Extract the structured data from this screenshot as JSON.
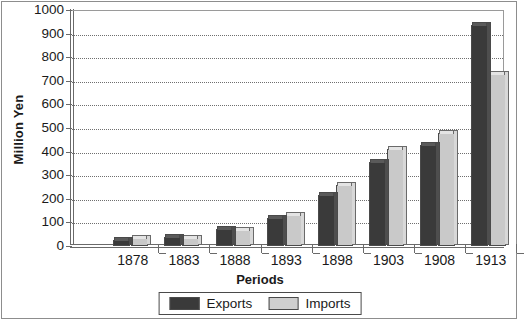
{
  "chart_data": {
    "type": "bar",
    "title": "",
    "xlabel": "Periods",
    "ylabel": "Million Yen",
    "categories": [
      "1878",
      "1883",
      "1888",
      "1893",
      "1898",
      "1903",
      "1908",
      "1913"
    ],
    "series": [
      {
        "name": "Exports",
        "color": "#3a3a3a",
        "values": [
          25,
          38,
          70,
          120,
          215,
          355,
          430,
          935
        ]
      },
      {
        "name": "Imports",
        "color": "#c9c9c9",
        "values": [
          32,
          32,
          68,
          130,
          260,
          410,
          480,
          730
        ]
      }
    ],
    "ylim": [
      0,
      1000
    ],
    "ytick_step": 100,
    "yticks": [
      "0",
      "100",
      "200",
      "300",
      "400",
      "500",
      "600",
      "700",
      "800",
      "900",
      "1000"
    ],
    "grid": true,
    "grid_style": "dotted-horizontal",
    "legend_position": "bottom-center",
    "units": "Million Yen"
  },
  "axes": {
    "y_title": "Million Yen",
    "x_title": "Periods"
  },
  "legend": {
    "entries": [
      {
        "label": "Exports",
        "swatch": "exports"
      },
      {
        "label": "Imports",
        "swatch": "imports"
      }
    ]
  },
  "colors": {
    "exports": "#3a3a3a",
    "imports": "#c9c9c9",
    "axis": "#6a6a6a",
    "grid": "#6f6f6f",
    "background": "#ffffff"
  }
}
